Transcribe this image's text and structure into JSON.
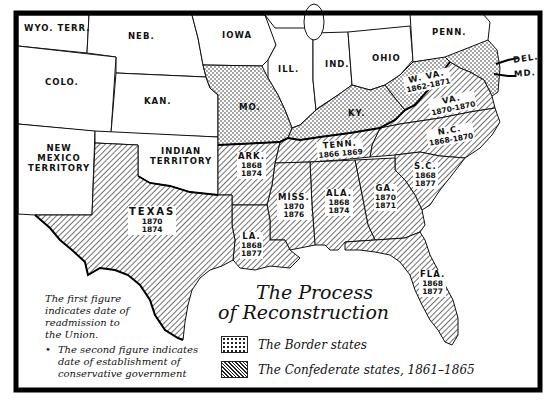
{
  "title": {
    "line1": "The Process",
    "line2": "of Reconstruction"
  },
  "legend": [
    {
      "pattern": "dotted",
      "label": "The Border states"
    },
    {
      "pattern": "hatched",
      "label": "The Confederate states, 1861–1865"
    }
  ],
  "notes": {
    "first": "The first figure indicates date of readmission to the Union.",
    "first_lines": [
      "The first figure",
      "indicates date of",
      "readmission to",
      "the Union."
    ],
    "bullet": "•",
    "second_lines": [
      "The second figure indicates",
      "date of establishment of",
      "conservative government"
    ]
  },
  "colors": {
    "ink": "#111111",
    "paper": "#ffffff",
    "frame": "#111111"
  },
  "other_states": [
    {
      "id": "wyo",
      "label": "WYO. TERR."
    },
    {
      "id": "neb",
      "label": "NEB."
    },
    {
      "id": "iowa",
      "label": "IOWA"
    },
    {
      "id": "ill",
      "label": "ILL."
    },
    {
      "id": "ind",
      "label": "IND."
    },
    {
      "id": "ohio",
      "label": "OHIO"
    },
    {
      "id": "penn",
      "label": "PENN."
    },
    {
      "id": "colo",
      "label": "COLO."
    },
    {
      "id": "kan",
      "label": "KAN."
    },
    {
      "id": "nm",
      "label_lines": [
        "NEW",
        "MEXICO",
        "TERRITORY"
      ]
    },
    {
      "id": "indian",
      "label_lines": [
        "INDIAN",
        "TERRITORY"
      ]
    }
  ],
  "border_states": [
    {
      "id": "mo",
      "label": "MO."
    },
    {
      "id": "ky",
      "label": "KY."
    },
    {
      "id": "wva",
      "label": "W. VA.",
      "years": "1862-1871"
    },
    {
      "id": "del",
      "label": "DEL."
    },
    {
      "id": "md",
      "label": "MD."
    }
  ],
  "confederate_states": [
    {
      "id": "tex",
      "label": "TEXAS",
      "readmitted": "1870",
      "conservative": "1874"
    },
    {
      "id": "ark",
      "label": "ARK.",
      "readmitted": "1868",
      "conservative": "1874"
    },
    {
      "id": "la",
      "label": "LA.",
      "readmitted": "1868",
      "conservative": "1877"
    },
    {
      "id": "miss",
      "label": "MISS.",
      "readmitted": "1870",
      "conservative": "1876"
    },
    {
      "id": "ala",
      "label": "ALA.",
      "readmitted": "1868",
      "conservative": "1874"
    },
    {
      "id": "ga",
      "label": "GA.",
      "readmitted": "1870",
      "conservative": "1871"
    },
    {
      "id": "fla",
      "label": "FLA.",
      "readmitted": "1868",
      "conservative": "1877"
    },
    {
      "id": "sc",
      "label": "S.C.",
      "readmitted": "1868",
      "conservative": "1877"
    },
    {
      "id": "nc",
      "label": "N.C.",
      "years": "1868-1870"
    },
    {
      "id": "va",
      "label": "VA.",
      "years": "1870-1870"
    },
    {
      "id": "tenn",
      "label": "TENN.",
      "years": "1866 1869"
    }
  ]
}
